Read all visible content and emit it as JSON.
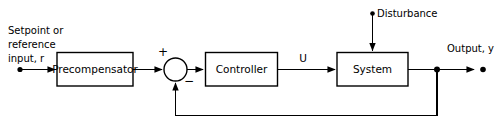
{
  "diagram": {
    "background_color": "#ffffff",
    "line_color": "#000000",
    "blocks": [
      {
        "id": "precompensator",
        "label": "Precompensator"
      },
      {
        "id": "controller",
        "label": "Controller"
      },
      {
        "id": "system",
        "label": "System"
      }
    ],
    "summing_junction": {
      "name": "summing-junction",
      "positive_sign": "+",
      "negative_sign": "−"
    },
    "labels": {
      "input_line1": "Setpoint or",
      "input_line2": "reference",
      "input_line3": "input, r",
      "disturbance": "Disturbance",
      "control_signal": "U",
      "output": "Output, y"
    }
  }
}
